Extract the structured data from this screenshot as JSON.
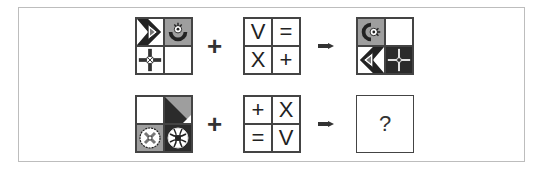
{
  "puzzle": {
    "row1": {
      "operator": "+",
      "symbols": [
        "V",
        "=",
        "X",
        "+"
      ],
      "arrow": "right-arrow",
      "cells_input": [
        {
          "bg": "#ffffff",
          "icon": "chevron-arrow-icon"
        },
        {
          "bg": "#9e9e9e",
          "icon": "semicircle-gear-icon"
        },
        {
          "bg": "#ffffff",
          "icon": "crosshair-plus-icon"
        },
        {
          "bg": "#ffffff",
          "icon": "empty"
        }
      ],
      "cells_output": [
        {
          "bg": "#9e9e9e",
          "icon": "semicircle-gear-rotated-icon"
        },
        {
          "bg": "#ffffff",
          "icon": "empty"
        },
        {
          "bg": "#ffffff",
          "icon": "chevron-arrow-mirrored-icon"
        },
        {
          "bg": "#2b2b2b",
          "icon": "crosshair-plus-inverted-icon"
        }
      ]
    },
    "row2": {
      "operator": "+",
      "symbols": [
        "+",
        "X",
        "=",
        "V"
      ],
      "arrow": "right-arrow",
      "cells_input": [
        {
          "bg": "#ffffff",
          "icon": "empty"
        },
        {
          "bg": "#ffffff",
          "icon": "diagonal-triangle-icon"
        },
        {
          "bg": "#9e9e9e",
          "icon": "x-circle-icon"
        },
        {
          "bg": "#2b2b2b",
          "icon": "globe-circle-icon"
        }
      ],
      "answer": "?"
    },
    "colors": {
      "border": "#444444",
      "gray": "#9e9e9e",
      "dark": "#2b2b2b",
      "frame": "#bdbdbd"
    }
  }
}
